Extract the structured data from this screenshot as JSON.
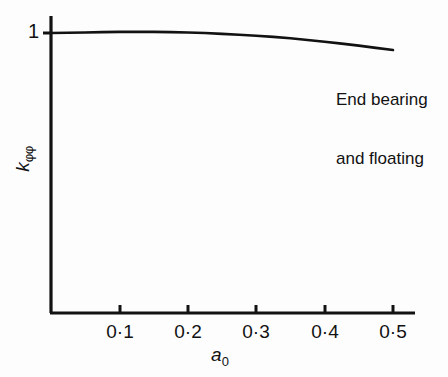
{
  "chart_data": {
    "type": "line",
    "title": "",
    "subtitle": "",
    "xlabel_text": "a",
    "xlabel_sub": "0",
    "ylabel_text": "k",
    "ylabel_sub": "φφ",
    "xlim": [
      0,
      0.535
    ],
    "ylim": [
      0,
      1.06
    ],
    "grid": false,
    "legend_position": "none",
    "xticks": [
      0.1,
      0.2,
      0.3,
      0.4,
      0.5
    ],
    "xticklabels": [
      "0·1",
      "0·2",
      "0·3",
      "0·4",
      "0·5"
    ],
    "yticks": [
      1
    ],
    "yticklabels": [
      "1"
    ],
    "series": [
      {
        "name": "End bearing and floating",
        "x": [
          0.0,
          0.025,
          0.05,
          0.075,
          0.1,
          0.125,
          0.15,
          0.175,
          0.2,
          0.225,
          0.25,
          0.275,
          0.3,
          0.325,
          0.35,
          0.375,
          0.4,
          0.425,
          0.45,
          0.475,
          0.5
        ],
        "values": [
          1.0,
          1.001,
          1.002,
          1.003,
          1.004,
          1.004,
          1.004,
          1.003,
          1.002,
          1.0,
          0.997,
          0.994,
          0.99,
          0.986,
          0.981,
          0.975,
          0.969,
          0.962,
          0.955,
          0.947,
          0.939
        ]
      }
    ],
    "annotations": [
      {
        "name": "curve-label",
        "lines": [
          "End bearing",
          "and floating"
        ],
        "x": 0.42,
        "y": 0.88
      }
    ],
    "colors": {
      "line": "#121212",
      "axis": "#121212",
      "text": "#121212",
      "background": "#fdfdfd"
    }
  }
}
